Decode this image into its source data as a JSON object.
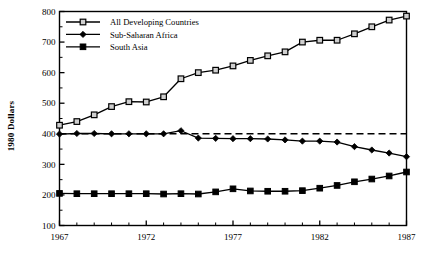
{
  "chart_data": {
    "type": "line",
    "title": "",
    "xlabel": "",
    "ylabel": "1980  Dollars",
    "xlim": [
      1967,
      1987
    ],
    "ylim": [
      100,
      800
    ],
    "grid": false,
    "legend_position": "top-left",
    "x": [
      1967,
      1968,
      1969,
      1970,
      1971,
      1972,
      1973,
      1974,
      1975,
      1976,
      1977,
      1978,
      1979,
      1980,
      1981,
      1982,
      1983,
      1984,
      1985,
      1986,
      1987
    ],
    "xticks": [
      1967,
      1972,
      1977,
      1982,
      1987
    ],
    "xticklabels": [
      "1967",
      "1972",
      "1977",
      "1982",
      "1987"
    ],
    "xminorticks": [
      1968,
      1969,
      1970,
      1971,
      1973,
      1974,
      1975,
      1976,
      1978,
      1979,
      1980,
      1981,
      1983,
      1984,
      1985,
      1986
    ],
    "yticks": [
      100,
      200,
      300,
      400,
      500,
      600,
      700,
      800
    ],
    "yticklabels": [
      "100",
      "200",
      "300",
      "400",
      "500",
      "600",
      "700",
      "800"
    ],
    "yminorticks": [
      150,
      250,
      350,
      450,
      550,
      650,
      750
    ],
    "reference_line": {
      "value": 400,
      "style": "dashed",
      "label": ""
    },
    "series": [
      {
        "name": "All Developing  Countries",
        "marker": "open-square",
        "color": "#000000",
        "values": [
          428,
          440,
          462,
          489,
          505,
          504,
          521,
          580,
          600,
          608,
          622,
          640,
          655,
          668,
          700,
          706,
          706,
          727,
          750,
          772,
          785
        ]
      },
      {
        "name": "Sub-Saharan Africa",
        "marker": "filled-diamond",
        "color": "#000000",
        "values": [
          399,
          401,
          401,
          400,
          400,
          400,
          400,
          410,
          386,
          385,
          384,
          384,
          383,
          380,
          376,
          376,
          373,
          358,
          347,
          337,
          325
        ]
      },
      {
        "name": "South Asia",
        "marker": "filled-square",
        "color": "#000000",
        "values": [
          205,
          204,
          204,
          204,
          204,
          204,
          203,
          204,
          203,
          210,
          220,
          213,
          212,
          212,
          214,
          222,
          231,
          243,
          252,
          262,
          275
        ]
      }
    ]
  },
  "legend": {
    "entries": [
      {
        "label": "All Developing  Countries",
        "marker": "open-square"
      },
      {
        "label": "Sub-Saharan Africa",
        "marker": "filled-diamond"
      },
      {
        "label": "South Asia",
        "marker": "filled-square"
      }
    ]
  },
  "axes": {
    "y_axis_title": "1980  Dollars"
  }
}
